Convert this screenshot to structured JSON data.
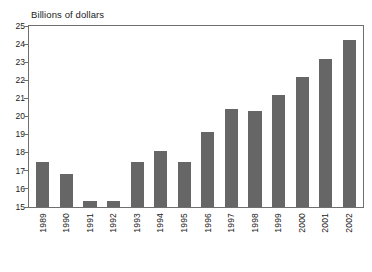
{
  "chart_data": {
    "type": "bar",
    "title": "",
    "ylabel": "Billions of dollars",
    "xlabel": "",
    "ylim": [
      15,
      25
    ],
    "yticks": [
      15,
      16,
      17,
      18,
      19,
      20,
      21,
      22,
      23,
      24,
      25
    ],
    "ytick_labels": [
      "15",
      "16",
      "17",
      "18",
      "19",
      "20",
      "21",
      "22",
      "23",
      "24",
      "25"
    ],
    "grid": false,
    "legend": null,
    "bar_color": "#666666",
    "frame_color": "#6f6f6f",
    "categories": [
      "1989",
      "1990",
      "1991",
      "1992",
      "1993",
      "1994",
      "1995",
      "1996",
      "1997",
      "1998",
      "1999",
      "2000",
      "2001",
      "2002"
    ],
    "values": [
      17.5,
      16.85,
      15.35,
      15.35,
      17.5,
      18.1,
      17.5,
      19.15,
      20.4,
      20.3,
      21.2,
      22.2,
      23.2,
      24.2
    ]
  }
}
